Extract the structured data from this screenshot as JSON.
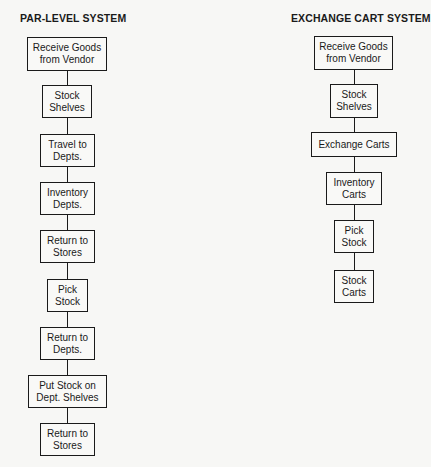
{
  "diagrams": [
    {
      "title": "PAR-LEVEL SYSTEM",
      "steps": [
        "Receive Goods\nfrom Vendor",
        "Stock\nShelves",
        "Travel to\nDepts.",
        "Inventory\nDepts.",
        "Return to\nStores",
        "Pick\nStock",
        "Return to\nDepts.",
        "Put Stock on\nDept. Shelves",
        "Return to\nStores"
      ]
    },
    {
      "title": "EXCHANGE CART SYSTEM",
      "steps": [
        "Receive Goods\nfrom Vendor",
        "Stock\nShelves",
        "Exchange Carts",
        "Inventory\nCarts",
        "Pick\nStock",
        "Stock\nCarts"
      ]
    }
  ]
}
